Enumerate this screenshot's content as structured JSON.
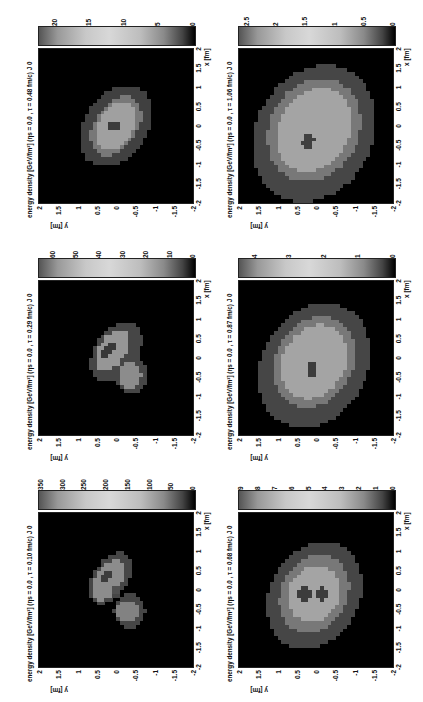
{
  "figure": {
    "orientation": "rotated 90 degrees counter-clockwise on page",
    "panels": [
      {
        "title": "energy density [GeV/fm³]  (ηs = 0.0 , τ = 0.10 fm/c)   J 0",
        "tau": "0.10 fm/c",
        "cbar_ticks": [
          "350",
          "300",
          "250",
          "200",
          "150",
          "100",
          "50",
          "0"
        ],
        "cbar_max": 350
      },
      {
        "title": "energy density [GeV/fm³]  (ηs = 0.0 , τ = 0.29 fm/c)   J 0",
        "tau": "0.29 fm/c",
        "cbar_ticks": [
          "60",
          "50",
          "40",
          "30",
          "20",
          "10",
          "0"
        ],
        "cbar_max": 65
      },
      {
        "title": "energy density [GeV/fm³]  (ηs = 0.0 , τ = 0.48 fm/c)   J 0",
        "tau": "0.48 fm/c",
        "cbar_ticks": [
          "20",
          "15",
          "10",
          "5",
          "0"
        ],
        "cbar_max": 22
      },
      {
        "title": "energy density [GeV/fm³]  (ηs = 0.0 , τ = 0.68 fm/c)   J 0",
        "tau": "0.68 fm/c",
        "cbar_ticks": [
          "9",
          "8",
          "7",
          "6",
          "5",
          "4",
          "3",
          "2",
          "1",
          "0"
        ],
        "cbar_max": 9
      },
      {
        "title": "energy density [GeV/fm³]  (ηs = 0.0 , τ = 0.87 fm/c)   J 0",
        "tau": "0.87 fm/c",
        "cbar_ticks": [
          "4",
          "3",
          "2",
          "1",
          "0"
        ],
        "cbar_max": 4.4
      },
      {
        "title": "energy density [GeV/fm³]  (ηs = 0.0 , τ = 1.06 fm/c)   J 0",
        "tau": "1.06 fm/c",
        "cbar_ticks": [
          "2.5",
          "2",
          "1.5",
          "1",
          "0.5",
          "0"
        ],
        "cbar_max": 2.6
      }
    ],
    "x_axis": {
      "label": "x [fm]",
      "ticks": [
        "-2",
        "-1.5",
        "-1",
        "-0.5",
        "0",
        "0.5",
        "1",
        "1.5",
        "2"
      ]
    },
    "y_axis": {
      "label": "y [fm]",
      "ticks": [
        "2",
        "1.5",
        "1",
        "0.5",
        "0",
        "-0.5",
        "-1",
        "-1.5",
        "-2"
      ]
    }
  }
}
